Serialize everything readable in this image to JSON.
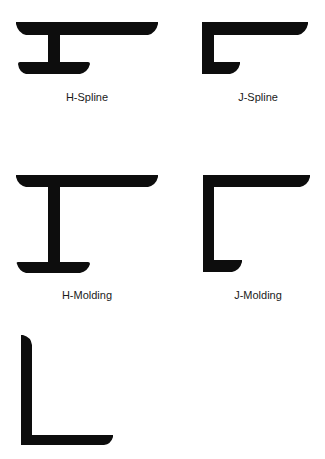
{
  "colors": {
    "profile_fill": "#0d0d0d",
    "background": "#ffffff",
    "label": "#1a1a1a"
  },
  "profiles": [
    {
      "id": "h-spline",
      "label": "H-Spline"
    },
    {
      "id": "j-spline",
      "label": "J-Spline"
    },
    {
      "id": "h-molding",
      "label": "H-Molding"
    },
    {
      "id": "j-molding",
      "label": "J-Molding"
    },
    {
      "id": "l-angle",
      "label": ""
    }
  ]
}
